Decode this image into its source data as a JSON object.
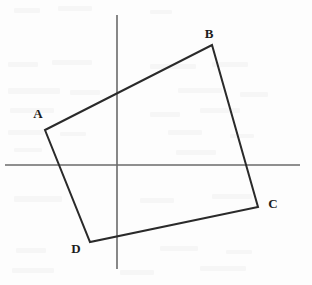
{
  "figure": {
    "kind": "geometry-diagram",
    "width": 312,
    "height": 285,
    "background_color": "#fdfdfd"
  },
  "colors": {
    "axis": "#6a6a6a",
    "shape_stroke": "#2a2a2a",
    "label_text": "#1c1c1c",
    "artifact": "#f0f0f0"
  },
  "axes": {
    "x_axis": {
      "name": "horizontal-axis",
      "x1": 5,
      "y1": 165,
      "x2": 300,
      "y2": 165,
      "stroke_width": 1.6
    },
    "y_axis": {
      "name": "vertical-axis",
      "x1": 117,
      "y1": 15,
      "x2": 117,
      "y2": 269,
      "stroke_width": 1.6
    },
    "origin": {
      "x": 117,
      "y": 165
    }
  },
  "shape": {
    "name": "quadrilateral-ABCD",
    "stroke_width": 2,
    "closed": true,
    "points": "45,130 212,45 258,207 90,242",
    "vertices": [
      {
        "id": "A",
        "label": "A",
        "x": 45,
        "y": 130,
        "label_x": 38,
        "label_y": 113
      },
      {
        "id": "B",
        "label": "B",
        "x": 212,
        "y": 45,
        "label_x": 209,
        "label_y": 33
      },
      {
        "id": "C",
        "label": "C",
        "x": 258,
        "y": 207,
        "label_x": 273,
        "label_y": 203
      },
      {
        "id": "D",
        "label": "D",
        "x": 90,
        "y": 242,
        "label_x": 76,
        "label_y": 248
      }
    ],
    "edges": [
      {
        "id": "AB",
        "from": "A",
        "to": "B"
      },
      {
        "id": "BC",
        "from": "B",
        "to": "C"
      },
      {
        "id": "CD",
        "from": "C",
        "to": "D"
      },
      {
        "id": "DA",
        "from": "D",
        "to": "A"
      }
    ]
  },
  "artifacts": [
    {
      "x": 14,
      "y": 8,
      "w": 26,
      "h": 5
    },
    {
      "x": 58,
      "y": 6,
      "w": 34,
      "h": 5
    },
    {
      "x": 150,
      "y": 10,
      "w": 22,
      "h": 4
    },
    {
      "x": 8,
      "y": 62,
      "w": 30,
      "h": 5
    },
    {
      "x": 52,
      "y": 60,
      "w": 40,
      "h": 5
    },
    {
      "x": 150,
      "y": 64,
      "w": 46,
      "h": 5
    },
    {
      "x": 212,
      "y": 62,
      "w": 36,
      "h": 5
    },
    {
      "x": 8,
      "y": 88,
      "w": 52,
      "h": 6
    },
    {
      "x": 70,
      "y": 90,
      "w": 30,
      "h": 5
    },
    {
      "x": 178,
      "y": 88,
      "w": 44,
      "h": 5
    },
    {
      "x": 240,
      "y": 92,
      "w": 28,
      "h": 5
    },
    {
      "x": 10,
      "y": 108,
      "w": 44,
      "h": 5
    },
    {
      "x": 150,
      "y": 112,
      "w": 30,
      "h": 5
    },
    {
      "x": 200,
      "y": 108,
      "w": 40,
      "h": 5
    },
    {
      "x": 8,
      "y": 130,
      "w": 36,
      "h": 5
    },
    {
      "x": 60,
      "y": 132,
      "w": 26,
      "h": 4
    },
    {
      "x": 168,
      "y": 130,
      "w": 34,
      "h": 5
    },
    {
      "x": 230,
      "y": 134,
      "w": 24,
      "h": 4
    },
    {
      "x": 14,
      "y": 148,
      "w": 28,
      "h": 4
    },
    {
      "x": 176,
      "y": 150,
      "w": 40,
      "h": 5
    },
    {
      "x": 14,
      "y": 196,
      "w": 48,
      "h": 6
    },
    {
      "x": 140,
      "y": 198,
      "w": 34,
      "h": 5
    },
    {
      "x": 212,
      "y": 194,
      "w": 40,
      "h": 5
    },
    {
      "x": 16,
      "y": 248,
      "w": 30,
      "h": 5
    },
    {
      "x": 160,
      "y": 246,
      "w": 38,
      "h": 5
    },
    {
      "x": 226,
      "y": 250,
      "w": 26,
      "h": 4
    },
    {
      "x": 12,
      "y": 268,
      "w": 42,
      "h": 5
    },
    {
      "x": 120,
      "y": 270,
      "w": 34,
      "h": 5
    },
    {
      "x": 200,
      "y": 266,
      "w": 46,
      "h": 5
    }
  ]
}
